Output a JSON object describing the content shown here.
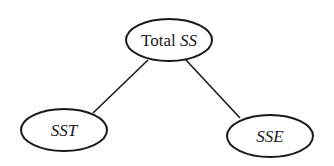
{
  "diagram": {
    "type": "tree",
    "nodes": [
      {
        "id": "total",
        "label_plain": "Total",
        "label_italic": "SS",
        "cx": 169,
        "cy": 40,
        "rx": 43,
        "ry": 21
      },
      {
        "id": "sst",
        "label_plain": "",
        "label_italic": "SST",
        "cx": 64,
        "cy": 130,
        "rx": 43,
        "ry": 21
      },
      {
        "id": "sse",
        "label_plain": "",
        "label_italic": "SSE",
        "cx": 270,
        "cy": 136,
        "rx": 43,
        "ry": 21
      }
    ],
    "edges": [
      {
        "from": "total",
        "to": "sst"
      },
      {
        "from": "total",
        "to": "sse"
      }
    ],
    "colors": {
      "stroke": "#1a1a1a",
      "background": "#ffffff"
    }
  }
}
